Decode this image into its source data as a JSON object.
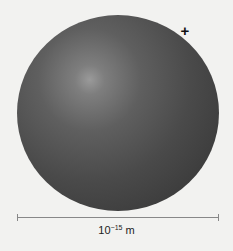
{
  "diagram": {
    "object": "sphere",
    "charge_symbol": "+",
    "scale": {
      "base": "10",
      "exponent": "−15",
      "unit": "m"
    },
    "colors": {
      "background": "#f2f2f0",
      "sphere_dark": "#363636",
      "sphere_highlight": "#9a9a9a",
      "scalebar": "#888888"
    }
  }
}
